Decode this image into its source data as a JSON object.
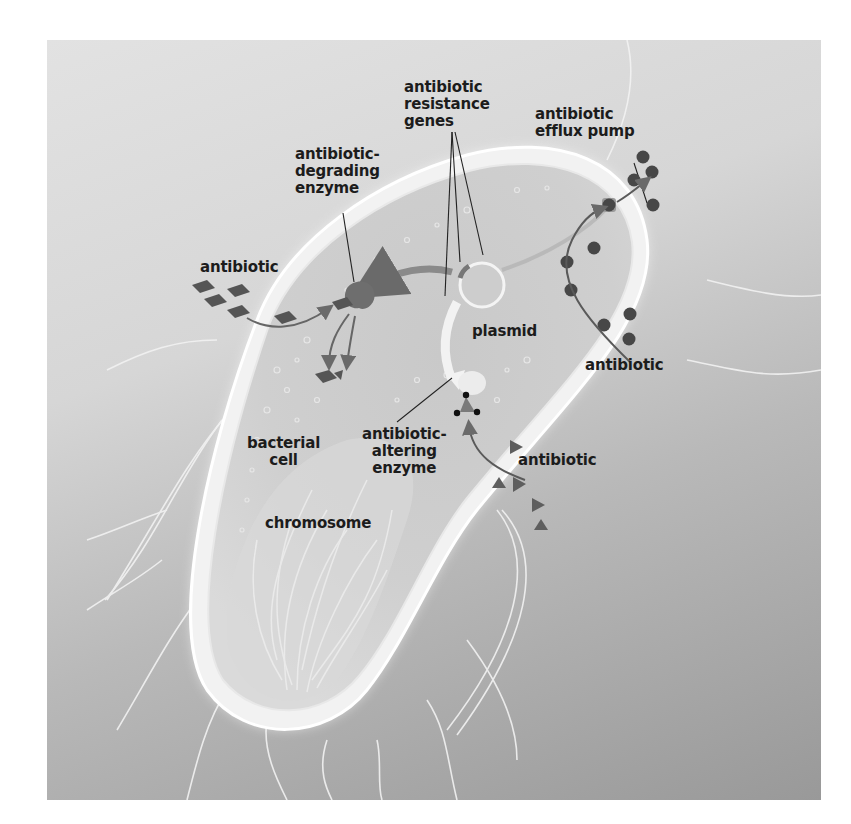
{
  "figure": {
    "colors": {
      "background_top": "#e2e2e2",
      "background_bottom": "#999999",
      "cell_fill": "#c8c8c8",
      "cell_wall": "#f4f4f4",
      "molecule": "#555555",
      "arrow": "#6a6a6a",
      "text": "#1c1c1c"
    }
  },
  "labels": {
    "resistance_genes": "antibiotic\nresistance\ngenes",
    "efflux_pump": "antibiotic\nefflux pump",
    "degrading_enzyme": "antibiotic-\ndegrading\nenzyme",
    "antibiotic_left": "antibiotic",
    "plasmid": "plasmid",
    "antibiotic_right": "antibiotic",
    "altering_enzyme": "antibiotic-\naltering\nenzyme",
    "antibiotic_bottom": "antibiotic",
    "bacterial_cell": "bacterial\ncell",
    "chromosome": "chromosome"
  },
  "molecules": {
    "diamonds_left": {
      "shape": "diamond",
      "count": 7
    },
    "circles_right": {
      "shape": "circle",
      "count": 11
    },
    "triangles_bottom": {
      "shape": "triangle",
      "count": 5
    }
  }
}
